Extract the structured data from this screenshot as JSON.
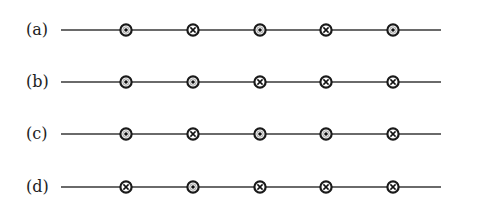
{
  "figure": {
    "legend": {
      "dot": "current out of page",
      "cross": "current into page"
    },
    "symbol_x_positions": [
      126,
      193,
      260,
      326,
      393
    ],
    "rows": [
      {
        "label": "(a)",
        "y": 30,
        "symbols": [
          "dot",
          "cross",
          "dot",
          "cross",
          "dot"
        ]
      },
      {
        "label": "(b)",
        "y": 82,
        "symbols": [
          "dot",
          "dot",
          "cross",
          "cross",
          "cross"
        ]
      },
      {
        "label": "(c)",
        "y": 134,
        "symbols": [
          "dot",
          "cross",
          "dot",
          "dot",
          "cross"
        ]
      },
      {
        "label": "(d)",
        "y": 187,
        "symbols": [
          "cross",
          "dot",
          "cross",
          "cross",
          "cross"
        ]
      }
    ]
  }
}
